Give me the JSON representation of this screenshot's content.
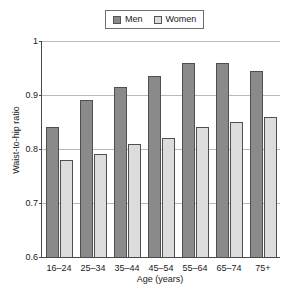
{
  "chart_data": {
    "type": "bar",
    "title": "",
    "xlabel": "Age (years)",
    "ylabel": "Waist-to-hip ratio",
    "categories": [
      "16–24",
      "25–34",
      "35–44",
      "45–54",
      "55–64",
      "65–74",
      "75+"
    ],
    "series": [
      {
        "name": "Men",
        "color": "#8a8a8a",
        "values": [
          0.84,
          0.89,
          0.915,
          0.935,
          0.96,
          0.96,
          0.945
        ]
      },
      {
        "name": "Women",
        "color": "#dcdcdc",
        "values": [
          0.78,
          0.79,
          0.81,
          0.82,
          0.84,
          0.85,
          0.86
        ]
      }
    ],
    "ylim": [
      0.6,
      1.0
    ],
    "yticks": [
      "0.6",
      "0.7",
      "0.8",
      "0.9",
      "1"
    ],
    "ytick_values": [
      0.6,
      0.7,
      0.8,
      0.9,
      1.0
    ],
    "grid": true,
    "legend_position": "top-center"
  }
}
